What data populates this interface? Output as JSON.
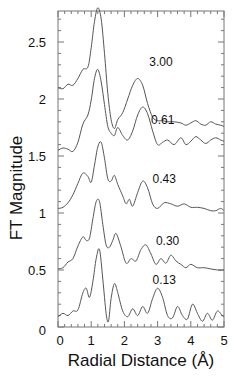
{
  "chart_data": {
    "type": "line",
    "title": "",
    "xlabel": "Radial Distance (Å)",
    "ylabel": "FT Magnitude",
    "xlim": [
      0,
      5
    ],
    "ylim": [
      0,
      2.77
    ],
    "grid": false,
    "legend": "none (inline labels next to each curve)",
    "x_ticks": [
      0,
      1,
      2,
      3,
      4,
      5
    ],
    "x_tick_labels": [
      "0",
      "1",
      "2",
      "3",
      "4",
      "5"
    ],
    "y_ticks": [
      0,
      0.5,
      1,
      1.5,
      2,
      2.5
    ],
    "y_tick_labels": [
      "0",
      "0.5",
      "1",
      "1.5",
      "2",
      "2.5"
    ],
    "series": [
      {
        "name": "3.00",
        "label_pos": [
          2.75,
          2.29
        ],
        "x": [
          0,
          0.15,
          0.3,
          0.45,
          0.6,
          0.75,
          0.9,
          1.0,
          1.1,
          1.2,
          1.3,
          1.4,
          1.5,
          1.6,
          1.7,
          1.8,
          1.95,
          2.1,
          2.25,
          2.4,
          2.55,
          2.7,
          2.85,
          3.0,
          3.15,
          3.3,
          3.5,
          3.7,
          3.85,
          4.0,
          4.15,
          4.3,
          4.45,
          4.6,
          4.75,
          4.9,
          5.0
        ],
        "y": [
          2.1,
          2.09,
          2.13,
          2.12,
          2.18,
          2.26,
          2.28,
          2.45,
          2.68,
          2.8,
          2.7,
          2.4,
          2.05,
          1.82,
          1.74,
          1.82,
          1.88,
          2.0,
          2.12,
          2.18,
          2.12,
          1.96,
          1.84,
          1.81,
          1.81,
          1.8,
          1.8,
          1.79,
          1.77,
          1.79,
          1.81,
          1.78,
          1.77,
          1.8,
          1.78,
          1.77,
          1.76
        ]
      },
      {
        "name": "0.61",
        "label_pos": [
          2.8,
          1.78
        ],
        "x": [
          0,
          0.15,
          0.3,
          0.45,
          0.6,
          0.75,
          0.9,
          1.0,
          1.1,
          1.2,
          1.3,
          1.4,
          1.5,
          1.6,
          1.7,
          1.8,
          1.95,
          2.1,
          2.25,
          2.4,
          2.55,
          2.7,
          2.85,
          3.0,
          3.15,
          3.3,
          3.5,
          3.7,
          3.85,
          4.0,
          4.15,
          4.3,
          4.45,
          4.6,
          4.75,
          4.9,
          5.0
        ],
        "y": [
          1.55,
          1.57,
          1.56,
          1.54,
          1.62,
          1.78,
          1.86,
          1.99,
          2.18,
          2.26,
          2.15,
          1.95,
          1.76,
          1.7,
          1.68,
          1.75,
          1.68,
          1.64,
          1.72,
          1.86,
          1.93,
          1.87,
          1.72,
          1.6,
          1.62,
          1.64,
          1.6,
          1.66,
          1.6,
          1.63,
          1.67,
          1.64,
          1.61,
          1.64,
          1.66,
          1.64,
          1.63
        ]
      },
      {
        "name": "0.43",
        "label_pos": [
          2.85,
          1.26
        ],
        "x": [
          0,
          0.15,
          0.3,
          0.45,
          0.6,
          0.75,
          0.9,
          1.0,
          1.1,
          1.2,
          1.3,
          1.4,
          1.5,
          1.6,
          1.7,
          1.8,
          1.95,
          2.05,
          2.15,
          2.25,
          2.4,
          2.55,
          2.7,
          2.85,
          3.0,
          3.2,
          3.4,
          3.6,
          3.8,
          4.0,
          4.2,
          4.4,
          4.6,
          4.75,
          4.9,
          5.0
        ],
        "y": [
          1.04,
          1.05,
          1.09,
          1.16,
          1.26,
          1.35,
          1.32,
          1.27,
          1.42,
          1.58,
          1.62,
          1.48,
          1.3,
          1.28,
          1.33,
          1.25,
          1.15,
          1.08,
          1.12,
          1.06,
          1.18,
          1.28,
          1.22,
          1.08,
          1.04,
          1.09,
          1.08,
          1.06,
          1.08,
          1.05,
          1.05,
          1.04,
          1.02,
          1.02,
          1.04,
          1.02
        ]
      },
      {
        "name": "0.30",
        "label_pos": [
          2.95,
          0.72
        ],
        "x": [
          0,
          0.15,
          0.3,
          0.45,
          0.6,
          0.75,
          0.85,
          0.95,
          1.05,
          1.15,
          1.25,
          1.35,
          1.45,
          1.55,
          1.65,
          1.75,
          1.9,
          2.05,
          2.2,
          2.35,
          2.5,
          2.65,
          2.8,
          2.95,
          3.1,
          3.25,
          3.4,
          3.55,
          3.7,
          3.85,
          4.0,
          4.2,
          4.4,
          4.6,
          4.8,
          5.0
        ],
        "y": [
          0.51,
          0.52,
          0.57,
          0.6,
          0.71,
          0.79,
          0.76,
          0.78,
          0.95,
          1.1,
          1.1,
          0.9,
          0.72,
          0.7,
          0.76,
          0.82,
          0.7,
          0.56,
          0.6,
          0.58,
          0.68,
          0.72,
          0.64,
          0.55,
          0.6,
          0.56,
          0.63,
          0.58,
          0.55,
          0.52,
          0.55,
          0.52,
          0.52,
          0.51,
          0.5,
          0.5
        ]
      },
      {
        "name": "0.13",
        "label_pos": [
          2.85,
          0.38
        ],
        "x": [
          0,
          0.15,
          0.3,
          0.45,
          0.6,
          0.75,
          0.85,
          0.95,
          1.05,
          1.15,
          1.25,
          1.35,
          1.45,
          1.52,
          1.6,
          1.7,
          1.8,
          1.95,
          2.1,
          2.25,
          2.4,
          2.55,
          2.7,
          2.85,
          3.0,
          3.15,
          3.3,
          3.45,
          3.6,
          3.75,
          3.9,
          4.05,
          4.2,
          4.35,
          4.5,
          4.65,
          4.8,
          4.95,
          5.0
        ],
        "y": [
          0.09,
          0.12,
          0.1,
          0.14,
          0.15,
          0.3,
          0.34,
          0.26,
          0.4,
          0.6,
          0.68,
          0.42,
          0.12,
          0.05,
          0.25,
          0.38,
          0.3,
          0.14,
          0.09,
          0.16,
          0.1,
          0.18,
          0.12,
          0.25,
          0.34,
          0.26,
          0.1,
          0.08,
          0.18,
          0.1,
          0.07,
          0.2,
          0.12,
          0.05,
          0.12,
          0.06,
          0.14,
          0.1,
          0.09
        ]
      }
    ],
    "plot_area_px": {
      "left": 58,
      "right": 224,
      "top": 11,
      "bottom": 327
    }
  }
}
